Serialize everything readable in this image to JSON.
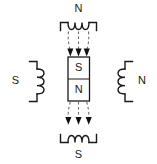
{
  "diagram": {
    "background_color": "#ffffff",
    "line_color": "#1a1a1a",
    "field_line_color": "#6f6f6f",
    "arrow_color": "#111111",
    "labels": {
      "top_coil_pole": "N",
      "bottom_coil_pole": "S",
      "left_coil_pole": "S",
      "right_coil_pole": "N",
      "magnet_top_pole": "S",
      "magnet_bottom_pole": "N"
    },
    "components": {
      "top_coil": {
        "name": "top-coil",
        "pole_label": "N",
        "turns": 3,
        "orientation": "horizontal"
      },
      "bottom_coil": {
        "name": "bottom-coil",
        "pole_label": "S",
        "turns": 3,
        "orientation": "horizontal"
      },
      "left_coil": {
        "name": "left-coil",
        "pole_label": "S",
        "turns": 3,
        "orientation": "vertical"
      },
      "right_coil": {
        "name": "right-coil",
        "pole_label": "N",
        "turns": 3,
        "orientation": "vertical"
      },
      "center_magnet": {
        "name": "center-bar-magnet",
        "top_pole": "S",
        "bottom_pole": "N"
      },
      "field_lines": {
        "upper_group_count": 3,
        "lower_group_count": 3,
        "direction": "downward",
        "style": "dashed-with-arrowhead"
      }
    }
  }
}
